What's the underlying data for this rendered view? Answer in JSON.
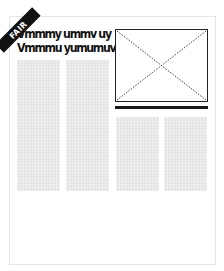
{
  "ribbon": {
    "label": "FAIR",
    "color": "#111111",
    "text_color": "#ffffff"
  },
  "headline": {
    "lines": [
      "Vmmmy ummv uy",
      "Vmmmu yumumuv"
    ]
  },
  "layout": {
    "columns": [
      {
        "name": "column-1",
        "fill": "#e3e3e3"
      },
      {
        "name": "column-2",
        "fill": "#e3e3e3"
      },
      {
        "name": "column-3",
        "fill": "#e3e3e3"
      },
      {
        "name": "column-4",
        "fill": "#e3e3e3"
      }
    ],
    "image_placeholder": {
      "border_color": "#222222",
      "cross_style": "dotted"
    },
    "divider": {
      "color": "#1a1a1a"
    },
    "card_border_color": "#e6e6e6"
  }
}
